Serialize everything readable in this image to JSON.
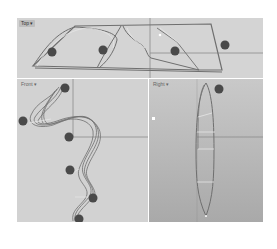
{
  "viewports": {
    "top": {
      "label": "Top",
      "menu_arrow": "▾"
    },
    "front": {
      "label": "Front",
      "menu_arrow": "▾"
    },
    "right": {
      "label": "Right",
      "menu_arrow": "▾"
    }
  },
  "colors": {
    "curve": "#6f6f6f",
    "curve_light": "#e8e8e8",
    "marker": "#4a4a4a",
    "axis": "#8a8a8a",
    "viewport_bg": "#d3d3d3"
  },
  "markers": {
    "top": [
      {
        "x": 35,
        "y": 34
      },
      {
        "x": 86,
        "y": 32
      },
      {
        "x": 158,
        "y": 33
      },
      {
        "x": 208,
        "y": 27
      }
    ],
    "front": [
      {
        "x": 45,
        "y": 39
      },
      {
        "x": 6,
        "y": 42
      },
      {
        "x": 83,
        "y": 82
      },
      {
        "x": 53,
        "y": 121
      },
      {
        "x": 76,
        "y": 119
      },
      {
        "x": 58,
        "y": 146
      }
    ],
    "right": [
      {
        "x": 70,
        "y": 10
      }
    ]
  }
}
